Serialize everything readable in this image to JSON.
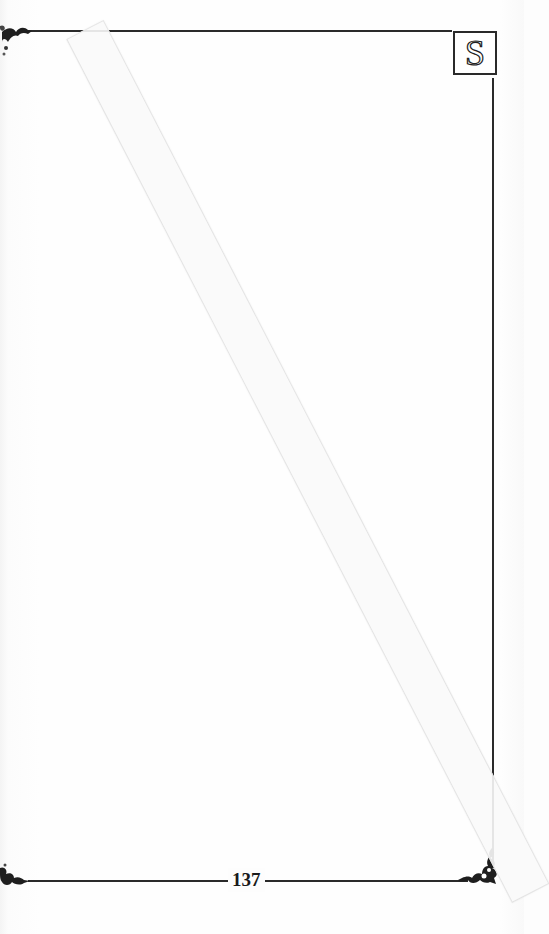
{
  "page": {
    "type": "scanned book page (blank)",
    "letter_tab": "S",
    "page_number": "137",
    "border_color": "#2a2a2a",
    "background_color": "#fdfdfd"
  },
  "decorations": {
    "corner_ornaments": [
      "top-left",
      "bottom-left",
      "bottom-right"
    ],
    "tape_strip": "diagonal translucent tape from top-left to bottom-right"
  }
}
